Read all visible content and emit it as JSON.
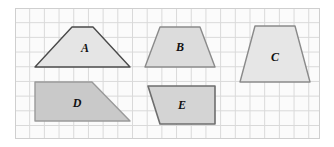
{
  "figure": {
    "background_color": "#ffffff",
    "grid": {
      "name": "square-grid",
      "panel_fill": "#fbfbfb",
      "line_color": "#d9d9d9",
      "border_color": "#cfcfcf",
      "cell_size_px": 14.7,
      "columns": 21,
      "rows": 9,
      "x": 15,
      "y": 8,
      "width": 305,
      "height": 131
    },
    "colors": {
      "shape_fill_light": "#e3e3e3",
      "shape_fill_dark": "#c9c9c9",
      "shape_stroke": "#6b6b6b",
      "shape_stroke_dark": "#555555",
      "label_color": "#111111"
    },
    "shapes": [
      {
        "id": "shape-a",
        "label": "A",
        "kind": "trapezoid",
        "fill": "#e5e5e5",
        "stroke": "#4a4a4a",
        "points": "72,27 93,27 130,67 35,67",
        "label_x": 85,
        "label_y": 49
      },
      {
        "id": "shape-b",
        "label": "B",
        "kind": "trapezoid",
        "fill": "#dcdcdc",
        "stroke": "#8a8a8a",
        "points": "160,27 200,27 215,67 145,67",
        "label_x": 180,
        "label_y": 48
      },
      {
        "id": "shape-c",
        "label": "C",
        "kind": "trapezoid",
        "fill": "#e6e6e6",
        "stroke": "#8a8a8a",
        "points": "255,26 295,26 310,82 240,82",
        "label_x": 275,
        "label_y": 58
      },
      {
        "id": "shape-d",
        "label": "D",
        "kind": "right-trapezoid",
        "fill": "#c9c9c9",
        "stroke": "#9a9a9a",
        "points": "35,82 92,82 130,121 35,121",
        "label_x": 77,
        "label_y": 104
      },
      {
        "id": "shape-e",
        "label": "E",
        "kind": "trapezoid",
        "fill": "#d4d4d4",
        "stroke": "#6e6e6e",
        "points": "148,86 215,86 215,124 160,124",
        "label_x": 182,
        "label_y": 106
      }
    ]
  }
}
